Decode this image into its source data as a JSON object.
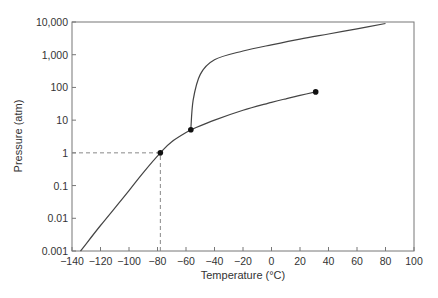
{
  "chart_data": {
    "type": "line",
    "title": "",
    "xlabel": "Temperature (°C)",
    "ylabel": "Pressure (atm)",
    "xlim": [
      -140,
      100
    ],
    "ylim": [
      0.001,
      10000
    ],
    "yscale": "log",
    "grid": false,
    "legend": null,
    "x_ticks": [
      -140,
      -120,
      -100,
      -80,
      -60,
      -40,
      -20,
      0,
      20,
      40,
      60,
      80,
      100
    ],
    "x_tick_labels": [
      "−140",
      "−120",
      "−100",
      "−80",
      "−60",
      "−40",
      "−20",
      "0",
      "20",
      "40",
      "60",
      "80",
      "100"
    ],
    "y_ticks": [
      0.001,
      0.01,
      0.1,
      1,
      10,
      100,
      1000,
      10000
    ],
    "y_tick_labels": [
      "0.001",
      "0.01",
      "0.1",
      "1",
      "10",
      "100",
      "1,000",
      "10,000"
    ],
    "series": [
      {
        "name": "sublimation-curve",
        "x": [
          -134,
          -120,
          -100,
          -90,
          -78,
          -70,
          -56.6
        ],
        "y": [
          0.001,
          0.006,
          0.07,
          0.25,
          1,
          2.2,
          5.1
        ]
      },
      {
        "name": "vaporization-curve",
        "x": [
          -56.6,
          -40,
          -20,
          0,
          10,
          20,
          31
        ],
        "y": [
          5.1,
          10,
          20,
          35,
          45,
          57,
          73
        ]
      },
      {
        "name": "melting-curve",
        "x": [
          -56.6,
          -55,
          -50,
          -40,
          -20,
          0,
          20,
          40,
          60,
          80
        ],
        "y": [
          5.1,
          40,
          250,
          700,
          1300,
          2000,
          3000,
          4300,
          6200,
          9000
        ]
      }
    ],
    "points": [
      {
        "name": "sublimation-point-1atm",
        "x": -78,
        "y": 1
      },
      {
        "name": "triple-point",
        "x": -56.6,
        "y": 5.1
      },
      {
        "name": "critical-point",
        "x": 31,
        "y": 73
      }
    ],
    "reference_lines": [
      {
        "type": "horizontal-dashed",
        "y": 1,
        "x_from": -140,
        "x_to": -78
      },
      {
        "type": "vertical-dashed",
        "x": -78,
        "y_from": 0.001,
        "y_to": 1
      }
    ]
  }
}
